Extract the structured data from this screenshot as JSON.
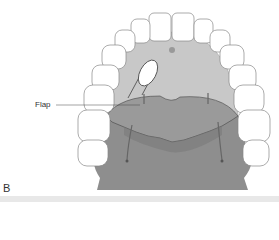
{
  "figure": {
    "panel_label": "B",
    "labels": {
      "flap": "Flap"
    },
    "colors": {
      "background": "#ffffff",
      "palate": "#c8c8c8",
      "flap": "#9a9a9a",
      "tissue_base": "#8e8e8e",
      "tooth_fill": "#ffffff",
      "tooth_outline": "#888888",
      "outline": "#444444"
    }
  }
}
